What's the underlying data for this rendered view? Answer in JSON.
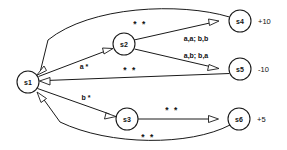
{
  "diagram": {
    "type": "state-machine",
    "background_color": "#ffffff",
    "stroke_color": "#1a1a1a",
    "nodes": [
      {
        "id": "s1",
        "label": "s1",
        "cx": 28,
        "cy": 82,
        "r": 11,
        "reward": ""
      },
      {
        "id": "s2",
        "label": "s2",
        "cx": 124,
        "cy": 44,
        "r": 11,
        "reward": ""
      },
      {
        "id": "s3",
        "label": "s3",
        "cx": 127,
        "cy": 119,
        "r": 11,
        "reward": ""
      },
      {
        "id": "s4",
        "label": "s4",
        "cx": 240,
        "cy": 21,
        "r": 11,
        "reward": "+10"
      },
      {
        "id": "s5",
        "label": "s5",
        "cx": 240,
        "cy": 69,
        "r": 11,
        "reward": "-10"
      },
      {
        "id": "s6",
        "label": "s6",
        "cx": 239,
        "cy": 119,
        "r": 11,
        "reward": "+5"
      }
    ],
    "reward_labels": [
      {
        "node": "s4",
        "text": "+10",
        "x": 258,
        "y": 21
      },
      {
        "node": "s5",
        "text": "-10",
        "x": 258,
        "y": 69
      },
      {
        "node": "s6",
        "text": "+5",
        "x": 257,
        "y": 119
      }
    ],
    "edges": [
      {
        "id": "s1-s2",
        "from": "s1",
        "to": "s2",
        "label": "a *",
        "label_x": 84,
        "label_y": 66
      },
      {
        "id": "s1-s3",
        "from": "s1",
        "to": "s3",
        "label": "b *",
        "label_x": 86,
        "label_y": 97
      },
      {
        "id": "s2-s4",
        "from": "s2",
        "to": "s4",
        "label": "a,a; b,b",
        "label_x": 196,
        "label_y": 38
      },
      {
        "id": "s2-s5",
        "from": "s2",
        "to": "s5",
        "label": "a,b; b,a",
        "label_x": 196,
        "label_y": 55
      },
      {
        "id": "s3-s6",
        "from": "s3",
        "to": "s6",
        "label": "* *",
        "label_x": 172,
        "label_y": 110
      },
      {
        "id": "s4-s1",
        "from": "s4",
        "to": "s1",
        "label": "* *",
        "label_x": 140,
        "label_y": 24
      },
      {
        "id": "s5-s1",
        "from": "s5",
        "to": "s1",
        "label": "* *",
        "label_x": 130,
        "label_y": 70
      },
      {
        "id": "s6-s1",
        "from": "s6",
        "to": "s1",
        "label": "* *",
        "label_x": 148,
        "label_y": 137
      }
    ]
  }
}
